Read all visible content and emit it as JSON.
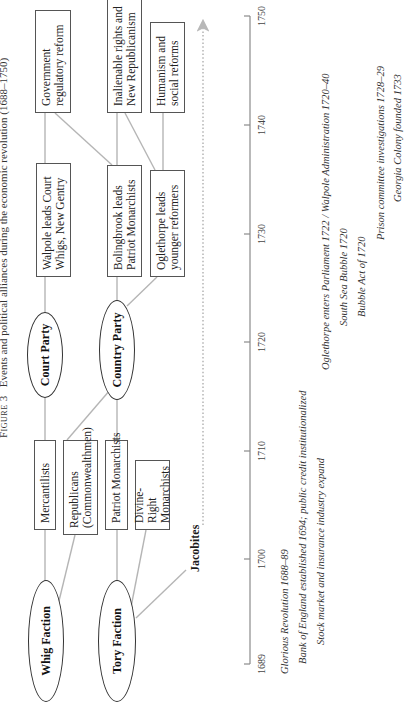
{
  "title": {
    "figure_label": "Figure 3",
    "text": "Events and political alliances during the economic revolution (1688–1750)"
  },
  "factions": {
    "whig": "Whig Faction",
    "tory": "Tory Faction"
  },
  "early_groups": {
    "mercantilists": "Mercantilists",
    "republicans": "Republicans (Commonwealthmen)",
    "patriot_monarchists": "Patriot Monarchists",
    "divine_right": "Divine-Right Monarchists"
  },
  "jacobites": "Jacobites",
  "parties": {
    "court": "Court Party",
    "country": "Country Party"
  },
  "leaders": {
    "walpole": "Walpole leads Court Whigs, New Gentry",
    "bolingbroke": "Bolingbrook leads Patriot Monarchists",
    "oglethorpe": "Oglethorpe leads younger reformers"
  },
  "outcomes": {
    "government": "Government regulatory reform",
    "inalienable": "Inalienable rights and New Republicanism",
    "humanism": "Humanism and social reforms"
  },
  "timeline": {
    "ticks": [
      "1689",
      "1700",
      "1710",
      "1720",
      "1730",
      "1740",
      "1750"
    ]
  },
  "events": [
    "Glorious Revolution 1688–89",
    "Bank of England established 1694; public credit institutionalized",
    "Stock market and insurance industry expand",
    "Oglethorpe enters Parliament 1722 / Walpole Administration 1720–40",
    "South Sea Bubble 1720",
    "Bubble Act of 1720",
    "Prison committee investigations 1728–29",
    "Georgia Colony founded 1733"
  ],
  "colors": {
    "connector": "#b0b0b0",
    "border": "#555555",
    "axis": "#888888"
  }
}
